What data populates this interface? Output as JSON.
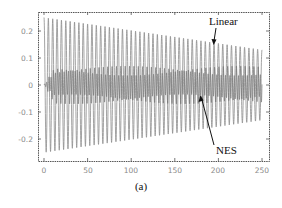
{
  "chart_data": {
    "type": "line",
    "title": "",
    "caption": "(a)",
    "xlabel": "",
    "ylabel": "",
    "xlim": [
      -7,
      258
    ],
    "ylim": [
      -0.28,
      0.27
    ],
    "x_ticks": [
      0,
      50,
      100,
      150,
      200,
      250
    ],
    "x_tick_labels": [
      "0",
      "50",
      "100",
      "150",
      "200",
      "250"
    ],
    "y_ticks": [
      0.2,
      0.1,
      0,
      -0.1,
      -0.2
    ],
    "y_tick_labels": [
      "0.2",
      "0.1",
      "0",
      "-0.1",
      "-0.2"
    ],
    "grid": false,
    "frame": true,
    "series": [
      {
        "name": "Linear",
        "description": "Lightly damped oscillation, period ~5 time units",
        "amplitude_start": 0.25,
        "amplitude_end": 0.13,
        "period": 5,
        "x_range": [
          0,
          250
        ],
        "color": "#8c8c8c"
      },
      {
        "name": "NES",
        "description": "Oscillation confined to a narrow band after short ramp from 0",
        "amplitude": 0.07,
        "period": 2.5,
        "x_range": [
          0,
          250
        ],
        "color": "#7a7a7a"
      }
    ],
    "annotations": [
      {
        "text": "Linear",
        "arrow_target_x": 195,
        "arrow_target_y": 0.15
      },
      {
        "text": "NES",
        "arrow_target_x": 180,
        "arrow_target_y": -0.04
      }
    ]
  },
  "labels": {
    "linear": "Linear",
    "nes": "NES",
    "caption": "(a)",
    "x0": "0",
    "x50": "50",
    "x100": "100",
    "x150": "150",
    "x200": "200",
    "x250": "250",
    "y02": "0.2",
    "y01": "0.1",
    "y0": "0",
    "ym01": "-0.1",
    "ym02": "-0.2"
  },
  "colors": {
    "frame": "#555555",
    "linear": "#8c8c8c",
    "nes": "#6f6f6f",
    "arrow": "#111111"
  }
}
